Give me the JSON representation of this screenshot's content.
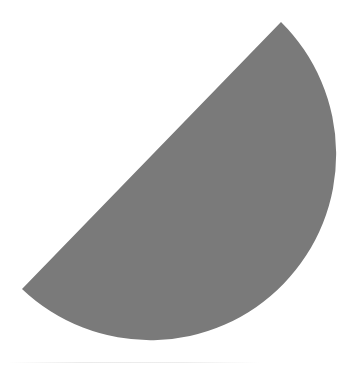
{
  "figure": {
    "fill_color": "#7a7a7a",
    "background_color": "#ffffff",
    "chord": {
      "start": [
        22,
        289
      ],
      "end": [
        281,
        22
      ]
    },
    "radius": 186,
    "arc_side": "bottom-right"
  }
}
